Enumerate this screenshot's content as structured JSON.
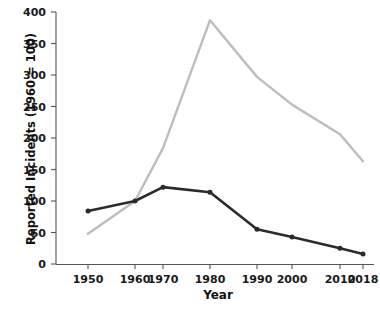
{
  "chart_data": {
    "type": "line",
    "title": "",
    "xlabel": "Year",
    "ylabel": "Reported Incidents (1960 = 100)",
    "x": [
      1950,
      1960,
      1970,
      1980,
      1990,
      2000,
      2010,
      2018
    ],
    "xtick_labels": [
      "1950",
      "1960",
      "1970",
      "1980",
      "1990",
      "2000",
      "2010",
      "2018"
    ],
    "ytick_labels": [
      "0",
      "50",
      "100",
      "150",
      "200",
      "250",
      "300",
      "350",
      "400"
    ],
    "yticks": [
      0,
      50,
      100,
      150,
      200,
      250,
      300,
      350,
      400
    ],
    "ylim": [
      0,
      400
    ],
    "xlim": [
      1950,
      2018
    ],
    "grid": false,
    "legend": "none",
    "series": [
      {
        "name": "light-series",
        "color": "#bdbdbd",
        "markers": false,
        "values": [
          48,
          100,
          184,
          387,
          297,
          253,
          206,
          163
        ]
      },
      {
        "name": "dark-series",
        "color": "#2b2b2b",
        "markers": true,
        "values": [
          84,
          100,
          122,
          114,
          55,
          43,
          25,
          16
        ]
      }
    ]
  },
  "axes": {
    "x_title": "Year",
    "y_title": "Reported Incidents (1960 = 100)"
  }
}
